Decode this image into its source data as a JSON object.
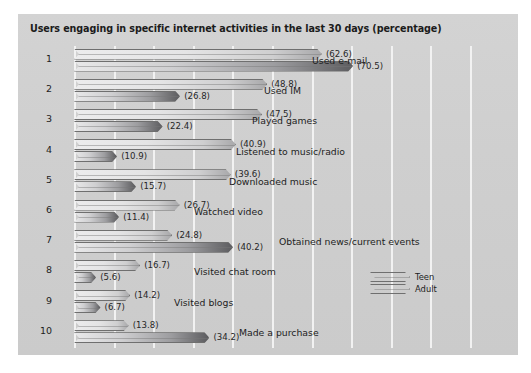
{
  "chart_data": {
    "type": "bar",
    "title": "Users engaging in specific internet activities in the last 30 days (percentage)",
    "orientation": "horizontal",
    "xlabel": "",
    "ylabel": "",
    "xlim": [
      0,
      100
    ],
    "grid": true,
    "grid_step": 10,
    "legend_position": "lower-right",
    "row_numbers": [
      "1",
      "2",
      "3",
      "4",
      "5",
      "6",
      "7",
      "8",
      "9",
      "10"
    ],
    "categories": [
      "Used e-mail",
      "Used IM",
      "Played games",
      "Listened to music/radio",
      "Downloaded music",
      "Watched video",
      "Obtained news/current events",
      "Visited chat room",
      "Visited blogs",
      "Made a purchase"
    ],
    "series": [
      {
        "name": "Teen",
        "values": [
          62.6,
          48.8,
          47.5,
          40.9,
          39.6,
          26.7,
          24.8,
          16.7,
          14.2,
          13.8
        ]
      },
      {
        "name": "Adult",
        "values": [
          70.5,
          26.8,
          22.4,
          10.9,
          15.7,
          11.4,
          40.2,
          5.6,
          6.7,
          34.2
        ]
      }
    ],
    "value_labels": [
      [
        "(62.6)",
        "(70.5)"
      ],
      [
        "(48.8)",
        "(26.8)"
      ],
      [
        "(47.5)",
        "(22.4)"
      ],
      [
        "(40.9)",
        "(10.9)"
      ],
      [
        "(39.6)",
        "(15.7)"
      ],
      [
        "(26.7)",
        "(11.4)"
      ],
      [
        "(24.8)",
        "(40.2)"
      ],
      [
        "(16.7)",
        "(5.6)"
      ],
      [
        "(14.2)",
        "(6.7)"
      ],
      [
        "(13.8)",
        "(34.2)"
      ]
    ],
    "colors": {
      "panel_background": "#d0d0d0",
      "gridline": "#f2f2f2",
      "teen_bar": "#e4e4e5",
      "adult_bar": "#9d9da0",
      "bar_outline": "#6f6f6f",
      "text": "#1d1d1d"
    }
  },
  "legend": {
    "teen_label": "Teen",
    "adult_label": "Adult"
  }
}
